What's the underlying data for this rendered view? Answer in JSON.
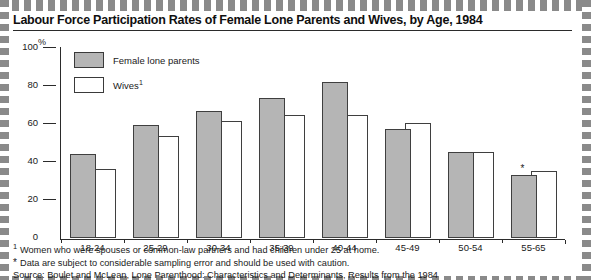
{
  "chart_title": "Labour Force Participation Rates of Female Lone Parents and Wives, by Age, 1984",
  "y_unit": "%",
  "legend": [
    {
      "label": "Female lone parents",
      "swatch": "gray-swatch",
      "color": "#b5b5b5"
    },
    {
      "label": "Wives",
      "label_sup": "1",
      "swatch": "white-swatch",
      "color": "#ffffff"
    }
  ],
  "footnotes": [
    {
      "mark": "1",
      "text": "Women who were spouses or common-law partners and had children under 25 at home."
    },
    {
      "mark": "*",
      "text": "Data are subject to considerable sampling error and should be used with caution."
    }
  ],
  "source_line": "Source: Boulet and McLean, Lone Parenthood: Characteristics and Determinants, Results from the 1984",
  "colors": {
    "female_lone_parents": "#b5b5b5",
    "wives": "#ffffff",
    "outline": "#3f3f3f",
    "axis": "#2b2b2b"
  },
  "chart_data": {
    "type": "bar",
    "title": "Labour Force Participation Rates of Female Lone Parents and Wives, by Age, 1984",
    "xlabel": "",
    "ylabel": "%",
    "ylim": [
      0,
      100
    ],
    "yticks": [
      0,
      20,
      40,
      60,
      80,
      100
    ],
    "grid": false,
    "legend_position": "upper-left-inside",
    "categories": [
      "18-24",
      "25-29",
      "30-34",
      "35-39",
      "40-44",
      "45-49",
      "50-54",
      "55-65"
    ],
    "series": [
      {
        "name": "Female lone parents",
        "values": [
          44,
          59,
          66,
          73,
          81,
          57,
          45,
          33
        ],
        "color": "#b5b5b5"
      },
      {
        "name": "Wives",
        "values": [
          36,
          53,
          61,
          64,
          64,
          60,
          45,
          35
        ],
        "color": "#ffffff"
      }
    ],
    "annotations": [
      {
        "category": "55-65",
        "series": "Female lone parents",
        "marker": "*",
        "note": "Data are subject to considerable sampling error and should be used with caution."
      }
    ]
  }
}
